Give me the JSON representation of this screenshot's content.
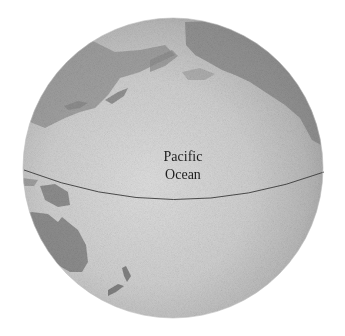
{
  "map": {
    "type": "globe",
    "projection": "orthographic",
    "centered_on": "Pacific Ocean",
    "labels": {
      "ocean_line1": "Pacific",
      "ocean_line2": "Ocean"
    },
    "features": [
      {
        "name": "equator",
        "type": "line"
      },
      {
        "name": "asia-landmass",
        "region": "upper-left"
      },
      {
        "name": "japan-islands",
        "region": "upper-left"
      },
      {
        "name": "north-america-landmass",
        "region": "upper-right"
      },
      {
        "name": "southeast-asia-islands",
        "region": "left"
      },
      {
        "name": "australia-landmass",
        "region": "lower-left"
      },
      {
        "name": "new-zealand-islands",
        "region": "lower-left"
      }
    ],
    "colors": {
      "background": "#ffffff",
      "ocean_light": "#d8d8d8",
      "ocean_dark": "#a9a9a9",
      "land": "#8a8a8a",
      "equator_line": "#3a3a3a",
      "label_text": "#1e1e1e"
    }
  }
}
